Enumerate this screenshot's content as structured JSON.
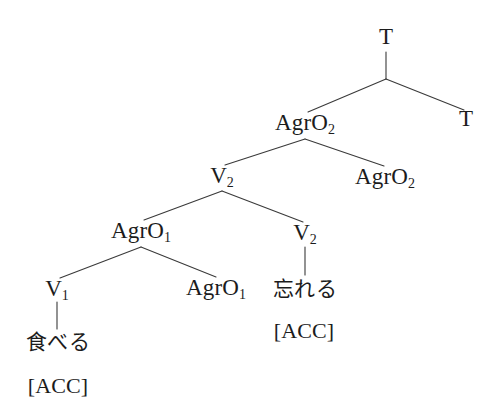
{
  "figure": {
    "kind": "syntax-tree",
    "background_color": "#ffffff",
    "line_color": "#3a3a3a",
    "text_color": "#1c1c1c"
  },
  "nodes": {
    "root_t": {
      "label": "T",
      "sub": "",
      "x": 386,
      "y": 38
    },
    "trace_t": {
      "label": "T",
      "sub": "",
      "x": 466,
      "y": 120
    },
    "agro2": {
      "label": "AgrO",
      "sub": "2",
      "x": 305,
      "y": 124
    },
    "trace_agro2": {
      "label": "AgrO",
      "sub": "2",
      "x": 385,
      "y": 178
    },
    "v2_upper": {
      "label": "V",
      "sub": "2",
      "x": 222,
      "y": 177
    },
    "agro1": {
      "label": "AgrO",
      "sub": "1",
      "x": 141,
      "y": 232
    },
    "trace_agro1": {
      "label": "AgrO",
      "sub": "1",
      "x": 216,
      "y": 289
    },
    "v2_lower": {
      "label": "V",
      "sub": "2",
      "x": 305,
      "y": 234
    },
    "v1": {
      "label": "V",
      "sub": "1",
      "x": 57,
      "y": 290
    },
    "taberu": {
      "label": "食べる",
      "x": 58,
      "y": 342
    },
    "taberu_case": {
      "label": "[ACC]",
      "x": 58,
      "y": 386
    },
    "wasureru": {
      "label": "忘れる",
      "x": 305,
      "y": 289
    },
    "wasureru_case": {
      "label": "[ACC]",
      "x": 304,
      "y": 331
    }
  },
  "edges": [
    {
      "name": "t-stem",
      "from": "root_t",
      "to": "t-branch-apex",
      "x1": 386,
      "y1": 52,
      "x2": 386,
      "y2": 79
    },
    {
      "name": "t-to-agro2",
      "from": "t-branch-apex",
      "to": "agro2",
      "x1": 386,
      "y1": 79,
      "x2": 308,
      "y2": 112
    },
    {
      "name": "t-to-trace-t",
      "from": "t-branch-apex",
      "to": "trace_t",
      "x1": 386,
      "y1": 79,
      "x2": 464,
      "y2": 110
    },
    {
      "name": "agro2-to-v2",
      "from": "agro2",
      "to": "v2_upper",
      "x1": 305,
      "y1": 139,
      "x2": 225,
      "y2": 165
    },
    {
      "name": "agro2-to-trace-agro2",
      "from": "agro2",
      "to": "trace_agro2",
      "x1": 305,
      "y1": 139,
      "x2": 384,
      "y2": 166
    },
    {
      "name": "v2-to-agro1",
      "from": "v2_upper",
      "to": "agro1",
      "x1": 222,
      "y1": 191,
      "x2": 144,
      "y2": 220
    },
    {
      "name": "v2-to-v2lower",
      "from": "v2_upper",
      "to": "v2_lower",
      "x1": 222,
      "y1": 191,
      "x2": 303,
      "y2": 222
    },
    {
      "name": "agro1-to-v1",
      "from": "agro1",
      "to": "v1",
      "x1": 141,
      "y1": 247,
      "x2": 60,
      "y2": 278
    },
    {
      "name": "agro1-to-trace-agro1",
      "from": "agro1",
      "to": "trace_agro1",
      "x1": 141,
      "y1": 247,
      "x2": 216,
      "y2": 277
    },
    {
      "name": "v1-stem",
      "from": "v1",
      "to": "taberu",
      "x1": 57,
      "y1": 302,
      "x2": 57,
      "y2": 329
    },
    {
      "name": "v2lower-stem",
      "from": "v2_lower",
      "to": "wasureru",
      "x1": 305,
      "y1": 247,
      "x2": 305,
      "y2": 275
    }
  ]
}
